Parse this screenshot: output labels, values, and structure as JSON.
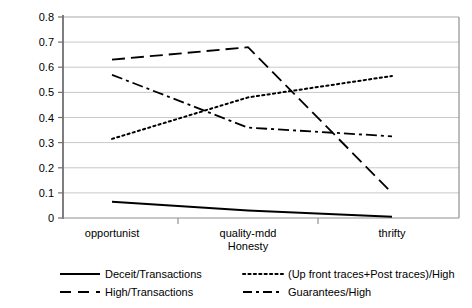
{
  "chart_data": {
    "type": "line",
    "title": "",
    "xlabel": "Honesty",
    "ylabel": "",
    "categories": [
      "opportunist",
      "quality-mdd",
      "thrifty"
    ],
    "ylim": [
      0,
      0.8
    ],
    "ytick_labels": [
      "0.8",
      "0.7",
      "0.6",
      "0.5",
      "0.4",
      "0.3",
      "0.2",
      "0.1",
      "0"
    ],
    "ytick_values": [
      0.8,
      0.7,
      0.6,
      0.5,
      0.4,
      0.3,
      0.2,
      0.1,
      0
    ],
    "grid": true,
    "legend_position": "bottom",
    "series": [
      {
        "name": "Deceit/Transactions",
        "style": "solid",
        "color": "#000000",
        "values": [
          0.065,
          0.03,
          0.005
        ]
      },
      {
        "name": "High/Transactions",
        "style": "dashed",
        "color": "#000000",
        "values": [
          0.63,
          0.68,
          0.1
        ]
      },
      {
        "name": "(Up front traces+Post traces)/High",
        "style": "dotted",
        "color": "#000000",
        "values": [
          0.315,
          0.48,
          0.565
        ]
      },
      {
        "name": "Guarantees/High",
        "style": "dashdot",
        "color": "#000000",
        "values": [
          0.57,
          0.36,
          0.325
        ]
      }
    ]
  },
  "axis": {
    "y_labels": {
      "t0": "0.8",
      "t1": "0.7",
      "t2": "0.6",
      "t3": "0.5",
      "t4": "0.4",
      "t5": "0.3",
      "t6": "0.2",
      "t7": "0.1",
      "t8": "0"
    },
    "x_labels": {
      "c0": "opportunist",
      "c1": "quality-mdd",
      "c2": "thrifty"
    },
    "x_title": "Honesty"
  },
  "legend": {
    "items": [
      {
        "label": "Deceit/Transactions",
        "style": "solid"
      },
      {
        "label": "(Up front traces+Post traces)/High",
        "style": "dotted"
      },
      {
        "label": "High/Transactions",
        "style": "dashed"
      },
      {
        "label": "Guarantees/High",
        "style": "dashdot"
      }
    ]
  },
  "colors": {
    "plot_border": "#808080",
    "gridline": "#c8c8c8",
    "series": "#000000",
    "background": "#ffffff"
  }
}
